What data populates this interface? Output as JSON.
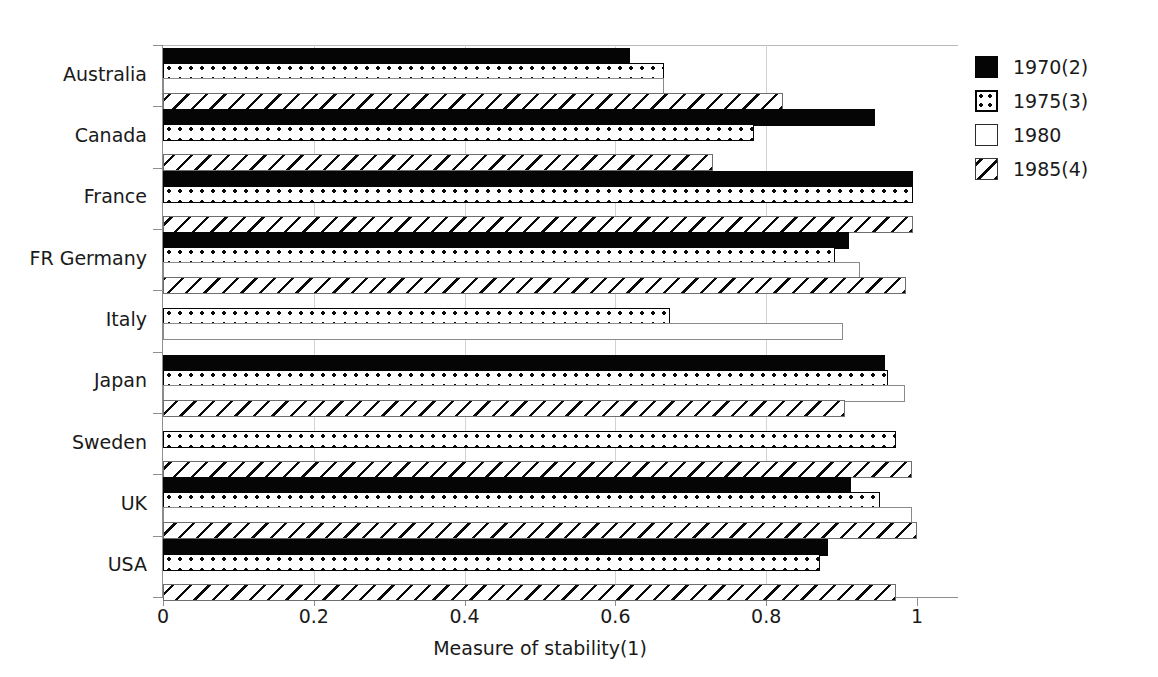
{
  "chart_data": {
    "type": "bar",
    "orientation": "horizontal",
    "title": "",
    "xlabel": "Measure of stability(1)",
    "ylabel": "",
    "xlim": [
      0,
      1.0
    ],
    "xticks": [
      0,
      0.2,
      0.4,
      0.6,
      0.8,
      1
    ],
    "xtick_labels": [
      "0",
      "0.2",
      "0.4",
      "0.6",
      "0.8",
      "1"
    ],
    "grid": true,
    "legend_position": "right",
    "categories": [
      "Australia",
      "Canada",
      "France",
      "FR Germany",
      "Italy",
      "Japan",
      "Sweden",
      "UK",
      "USA"
    ],
    "series": [
      {
        "name": "1970(2)",
        "pattern": "solid-black",
        "color": "#050505",
        "values": [
          0.62,
          0.944,
          0.995,
          0.91,
          null,
          0.957,
          null,
          0.912,
          0.882
        ]
      },
      {
        "name": "1975(3)",
        "pattern": "dotted",
        "color": "#ffffff",
        "values": [
          0.665,
          0.784,
          0.995,
          0.891,
          0.673,
          0.961,
          0.972,
          0.951,
          0.871
        ]
      },
      {
        "name": "1980",
        "pattern": "empty",
        "color": "#ffffff",
        "values": [
          0.665,
          null,
          null,
          0.924,
          0.902,
          0.984,
          null,
          0.993,
          null
        ]
      },
      {
        "name": "1985(4)",
        "pattern": "diagonal-hatch",
        "color": "#ffffff",
        "values": [
          0.822,
          0.73,
          0.995,
          0.985,
          null,
          0.904,
          0.993,
          1.0,
          0.972
        ]
      }
    ]
  },
  "legend": {
    "items": [
      {
        "label": "1970(2)",
        "swatch": "legend-swatch-1970"
      },
      {
        "label": "1975(3)",
        "swatch": "legend-swatch-1975"
      },
      {
        "label": "1980",
        "swatch": "legend-swatch-1980"
      },
      {
        "label": "1985(4)",
        "swatch": "legend-swatch-1985"
      }
    ]
  }
}
